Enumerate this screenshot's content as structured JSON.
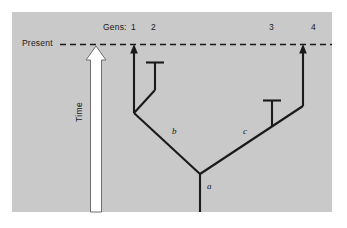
{
  "figure": {
    "kind": "phylogeny-diagram",
    "background_color": "#ffffff",
    "panel_color": "#c9c9c9",
    "ink_color": "#1a1a1a"
  },
  "axis": {
    "present_label": "Present",
    "time_label": "Time",
    "gens_label": "Gens:"
  },
  "generations": [
    {
      "id": "gen-1",
      "label": "1"
    },
    {
      "id": "gen-2",
      "label": "2"
    },
    {
      "id": "gen-3",
      "label": "3"
    },
    {
      "id": "gen-4",
      "label": "4"
    }
  ],
  "nodes": [
    {
      "id": "node-a",
      "label": "a"
    },
    {
      "id": "node-b",
      "label": "b"
    },
    {
      "id": "node-c",
      "label": "c"
    }
  ]
}
